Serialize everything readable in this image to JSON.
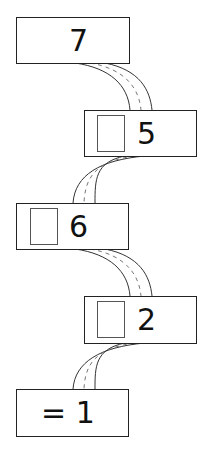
{
  "diagram": {
    "type": "number-chain",
    "boxes": [
      {
        "label": "7",
        "has_blank": false
      },
      {
        "label": "5",
        "has_blank": true
      },
      {
        "label": "6",
        "has_blank": true
      },
      {
        "label": "2",
        "has_blank": true
      },
      {
        "label": "= 1",
        "has_blank": false
      }
    ],
    "connectors": "curved dashed roads linking boxes in sequence"
  }
}
